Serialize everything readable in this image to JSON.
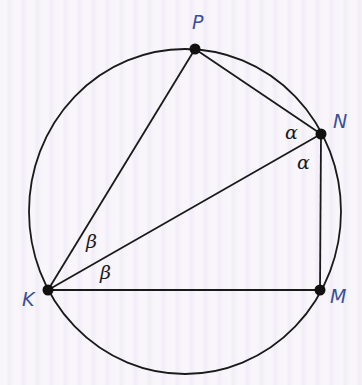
{
  "diagram": {
    "type": "inscribed-quadrilateral",
    "colors": {
      "stroke": "#1a1a1a",
      "point_label": "#3a4f9a",
      "angle_label": "#1a1a1a",
      "background": "#f5f1f9"
    },
    "circle": {
      "cx": 185,
      "cy": 211,
      "rx": 156,
      "ry": 162
    },
    "points": {
      "P": {
        "label": "P",
        "x": 195,
        "y": 49
      },
      "N": {
        "label": "N",
        "x": 321,
        "y": 134
      },
      "M": {
        "label": "M",
        "x": 320,
        "y": 290
      },
      "K": {
        "label": "K",
        "x": 48,
        "y": 290
      }
    },
    "segments": [
      [
        "K",
        "P"
      ],
      [
        "P",
        "N"
      ],
      [
        "N",
        "M"
      ],
      [
        "M",
        "K"
      ],
      [
        "K",
        "N"
      ]
    ],
    "angle_labels": {
      "alpha_upper": "α",
      "alpha_lower": "α",
      "beta_upper": "β",
      "beta_lower": "β"
    }
  }
}
